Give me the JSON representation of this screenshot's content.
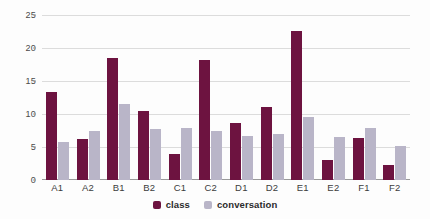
{
  "chart_data": {
    "type": "bar",
    "title": "",
    "subtitle": "",
    "xlabel": "",
    "ylabel": "",
    "ylim": [
      0,
      25
    ],
    "yticks": [
      0,
      5,
      10,
      15,
      20,
      25
    ],
    "ytick_labels": [
      "0",
      "5",
      "10",
      "15",
      "20",
      "25"
    ],
    "grid": true,
    "legend_position": "bottom-center",
    "categories": [
      "A1",
      "A2",
      "B1",
      "B2",
      "C1",
      "C2",
      "D1",
      "D2",
      "E1",
      "E2",
      "F1",
      "F2"
    ],
    "series": [
      {
        "name": "class",
        "color": "#6d1340",
        "values": [
          13.3,
          6.2,
          18.5,
          10.5,
          4.0,
          18.2,
          8.7,
          11.0,
          22.6,
          3.0,
          6.4,
          2.3
        ]
      },
      {
        "name": "conversation",
        "color": "#b9b5c8",
        "values": [
          5.8,
          7.4,
          11.5,
          7.8,
          7.9,
          7.4,
          6.7,
          6.9,
          9.5,
          6.5,
          7.9,
          5.1
        ]
      }
    ]
  },
  "legend": {
    "items": [
      {
        "label": "class",
        "color": "#6d1340"
      },
      {
        "label": "conversation",
        "color": "#b9b5c8"
      }
    ]
  },
  "colors": {
    "class": "#6d1340",
    "conversation": "#b9b5c8",
    "grid": "#dcdcdc",
    "axis": "#9a9a9a",
    "background": "#fdfdfd",
    "tick_text": "#4a4a4a"
  }
}
